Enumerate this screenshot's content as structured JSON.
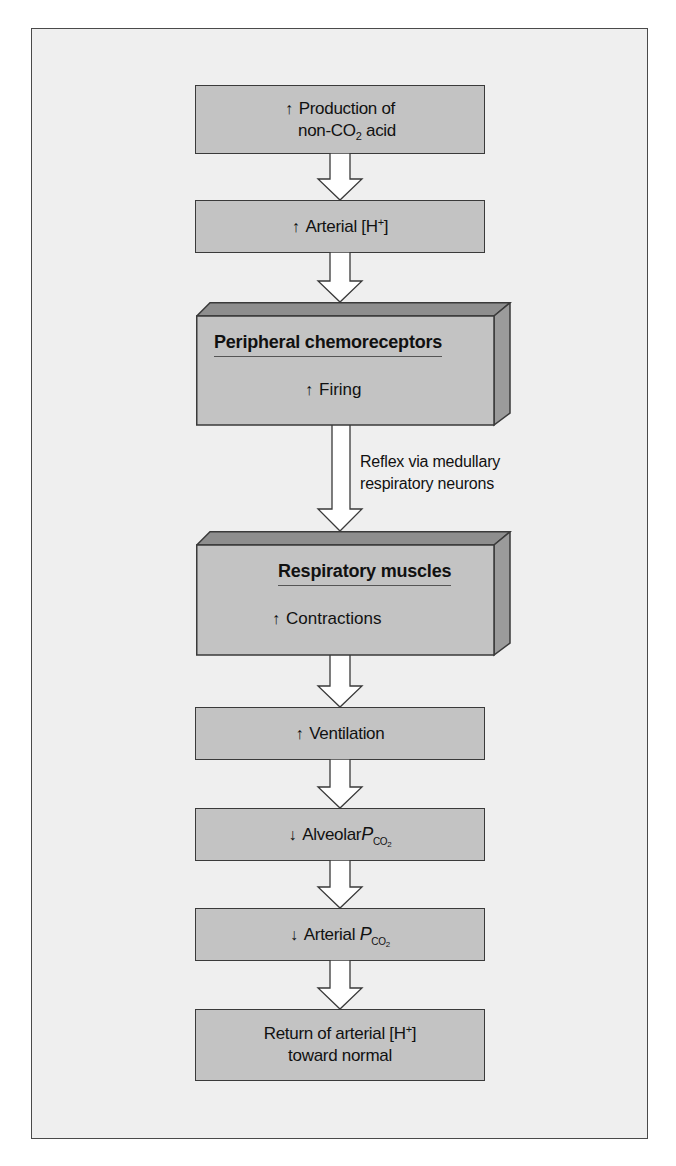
{
  "diagram": {
    "type": "flowchart",
    "direction": "top-to-bottom",
    "colors": {
      "panel_background": "#efefef",
      "box_fill": "#c3c3c3",
      "box_border": "#3a3a3a",
      "bevel_top": "#8e8e8e",
      "bevel_side": "#9b9b9b",
      "arrow_fill": "#ffffff"
    },
    "nodes": [
      {
        "id": "n1",
        "indicator": "↑",
        "line1": "Production of",
        "line2_pre": "non-CO",
        "line2_sub": "2",
        "line2_post": " acid"
      },
      {
        "id": "n2",
        "indicator": "↑",
        "text": "Arterial [H",
        "sup": "+",
        "text_post": "]"
      },
      {
        "id": "n3",
        "title": "Peripheral chemoreceptors",
        "indicator": "↑",
        "label": "Firing",
        "style": "3d"
      },
      {
        "id": "n4",
        "title": "Respiratory muscles",
        "indicator": "↑",
        "label": "Contractions",
        "style": "3d"
      },
      {
        "id": "n5",
        "indicator": "↑",
        "text": "Ventilation"
      },
      {
        "id": "n6",
        "indicator": "↓",
        "text": "Alveolar",
        "p": "P",
        "p_sub": "CO",
        "p_sub2": "2"
      },
      {
        "id": "n7",
        "indicator": "↓",
        "text": "Arterial ",
        "p": "P",
        "p_sub": "CO",
        "p_sub2": "2"
      },
      {
        "id": "n8",
        "line1_pre": "Return of arterial [H",
        "line1_sup": "+",
        "line1_post": "]",
        "line2": "toward normal"
      }
    ],
    "edges": [
      {
        "from": "n1",
        "to": "n2"
      },
      {
        "from": "n2",
        "to": "n3"
      },
      {
        "from": "n3",
        "to": "n4",
        "label_line1": "Reflex via medullary",
        "label_line2": "respiratory neurons"
      },
      {
        "from": "n4",
        "to": "n5"
      },
      {
        "from": "n5",
        "to": "n6"
      },
      {
        "from": "n6",
        "to": "n7"
      },
      {
        "from": "n7",
        "to": "n8"
      }
    ]
  }
}
